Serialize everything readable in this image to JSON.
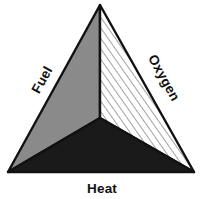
{
  "figure": {
    "name": "fire-triangle",
    "background_color": "#ffffff"
  },
  "labels": {
    "fuel": "Fuel",
    "oxygen": "Oxygen",
    "heat": "Heat"
  },
  "geometry": {
    "apex": [
      100,
      5
    ],
    "bottom_left": [
      8,
      172
    ],
    "bottom_right": [
      194,
      172
    ],
    "center": [
      100,
      118
    ]
  },
  "sections": [
    {
      "id": "fuel-section",
      "label": "Fuel",
      "fill_style": "solid-gray",
      "fill_color": "#8a8a8a",
      "stroke_color": "#111111"
    },
    {
      "id": "oxygen-section",
      "label": "Oxygen",
      "fill_style": "diagonal-hatch",
      "fill_color": "#ffffff",
      "hatch_color": "#555555",
      "stroke_color": "#111111"
    },
    {
      "id": "heat-section",
      "label": "Heat",
      "fill_style": "solid-black",
      "fill_color": "#1a1a1a",
      "stroke_color": "#111111"
    }
  ]
}
